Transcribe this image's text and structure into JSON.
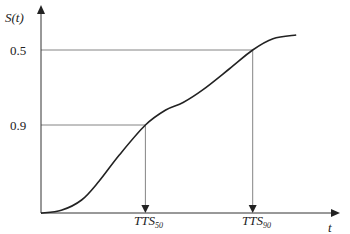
{
  "diagram": {
    "y_axis_label": "S(t)",
    "x_axis_label": "t",
    "y_ticks": [
      {
        "label": "0.9",
        "value": 0.9
      },
      {
        "label": "0.5",
        "value": 0.5
      }
    ],
    "markers": [
      {
        "label_main": "TTS",
        "label_sub": "50",
        "s_value": 0.5,
        "t_value": 0.36
      },
      {
        "label_main": "TTS",
        "label_sub": "90",
        "s_value": 0.9,
        "t_value": 0.73
      }
    ],
    "curve": {
      "description": "Survival-type S-curve rising from near 0 through 0.5 at TTS50 and 0.9 at TTS90, leveling off near 0.97",
      "points": [
        [
          0.0,
          0.03
        ],
        [
          0.07,
          0.045
        ],
        [
          0.14,
          0.1
        ],
        [
          0.2,
          0.2
        ],
        [
          0.27,
          0.34
        ],
        [
          0.36,
          0.5
        ],
        [
          0.43,
          0.58
        ],
        [
          0.49,
          0.62
        ],
        [
          0.56,
          0.69
        ],
        [
          0.65,
          0.8
        ],
        [
          0.73,
          0.9
        ],
        [
          0.8,
          0.96
        ],
        [
          0.88,
          0.98
        ]
      ]
    },
    "colors": {
      "curve": "#222222",
      "guides": "#777777",
      "axes": "#333333"
    }
  }
}
